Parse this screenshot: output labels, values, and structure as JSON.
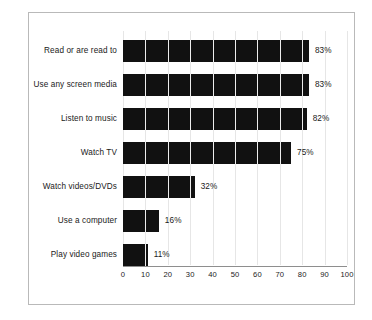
{
  "figure": {
    "clipped_title": "",
    "frame_color": "#b9b9b9",
    "background": "#ffffff",
    "bar_color": "#111111",
    "gridline_color": "#e6e6e6",
    "text_color": "#1a1a1a"
  },
  "chart_data": {
    "type": "bar",
    "orientation": "horizontal",
    "title": "",
    "subtitle": "",
    "xlabel": "",
    "ylabel": "",
    "xlim": [
      0,
      100
    ],
    "xticks": [
      0,
      10,
      20,
      30,
      40,
      50,
      60,
      70,
      80,
      90,
      100
    ],
    "xtick_labels": [
      "0",
      "10",
      "20",
      "30",
      "40",
      "50",
      "60",
      "70",
      "80",
      "90",
      "100"
    ],
    "grid": true,
    "legend": false,
    "categories": [
      "Read or are read to",
      "Use any screen media",
      "Listen to music",
      "Watch TV",
      "Watch videos/DVDs",
      "Use a computer",
      "Play video games"
    ],
    "values": [
      83,
      83,
      82,
      75,
      32,
      16,
      11
    ],
    "data_labels": [
      "83%",
      "83%",
      "82%",
      "75%",
      "32%",
      "16%",
      "11%"
    ]
  }
}
